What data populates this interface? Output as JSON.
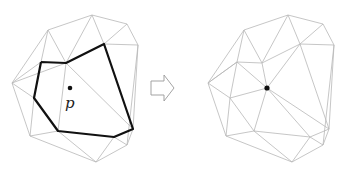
{
  "diagram": {
    "left": {
      "point_label": "p",
      "point": [
        70,
        88
      ],
      "vertices": {
        "A": [
          48,
          30
        ],
        "B": [
          92,
          15
        ],
        "C": [
          127,
          24
        ],
        "D": [
          138,
          45
        ],
        "E": [
          12,
          83
        ],
        "F": [
          41,
          62
        ],
        "G": [
          66,
          63
        ],
        "H": [
          104,
          44
        ],
        "I": [
          34,
          98
        ],
        "J": [
          58,
          131
        ],
        "K": [
          114,
          137
        ],
        "L": [
          133,
          129
        ],
        "M": [
          30,
          136
        ],
        "N": [
          96,
          162
        ],
        "O": [
          127,
          145
        ]
      },
      "polygon": [
        "F",
        "G",
        "H",
        "L",
        "K",
        "J",
        "I"
      ],
      "edges": [
        [
          "A",
          "B"
        ],
        [
          "B",
          "C"
        ],
        [
          "C",
          "D"
        ],
        [
          "A",
          "E"
        ],
        [
          "E",
          "M"
        ],
        [
          "M",
          "N"
        ],
        [
          "N",
          "O"
        ],
        [
          "O",
          "D"
        ],
        [
          "A",
          "F"
        ],
        [
          "A",
          "G"
        ],
        [
          "B",
          "G"
        ],
        [
          "B",
          "H"
        ],
        [
          "C",
          "H"
        ],
        [
          "D",
          "H"
        ],
        [
          "E",
          "F"
        ],
        [
          "E",
          "I"
        ],
        [
          "E",
          "G"
        ],
        [
          "I",
          "M"
        ],
        [
          "M",
          "J"
        ],
        [
          "J",
          "N"
        ],
        [
          "K",
          "N"
        ],
        [
          "K",
          "O"
        ],
        [
          "L",
          "O"
        ],
        [
          "G",
          "J"
        ],
        [
          "G",
          "L"
        ],
        [
          "D",
          "L"
        ]
      ]
    },
    "arrow": {
      "direction": "right",
      "x": 161,
      "y": 88
    },
    "right": {
      "point": [
        267,
        88
      ],
      "vertices": {
        "A": [
          244,
          30
        ],
        "B": [
          288,
          15
        ],
        "C": [
          323,
          24
        ],
        "D": [
          334,
          45
        ],
        "E": [
          208,
          83
        ],
        "F": [
          237,
          62
        ],
        "G": [
          262,
          63
        ],
        "H": [
          300,
          44
        ],
        "I": [
          230,
          98
        ],
        "J": [
          254,
          131
        ],
        "K": [
          310,
          137
        ],
        "L": [
          329,
          129
        ],
        "M": [
          226,
          136
        ],
        "N": [
          292,
          162
        ],
        "O": [
          323,
          145
        ]
      },
      "edges": [
        [
          "A",
          "B"
        ],
        [
          "B",
          "C"
        ],
        [
          "C",
          "D"
        ],
        [
          "A",
          "E"
        ],
        [
          "E",
          "M"
        ],
        [
          "M",
          "N"
        ],
        [
          "N",
          "O"
        ],
        [
          "O",
          "D"
        ],
        [
          "A",
          "F"
        ],
        [
          "A",
          "G"
        ],
        [
          "B",
          "G"
        ],
        [
          "B",
          "H"
        ],
        [
          "C",
          "H"
        ],
        [
          "D",
          "H"
        ],
        [
          "E",
          "F"
        ],
        [
          "E",
          "I"
        ],
        [
          "I",
          "M"
        ],
        [
          "M",
          "J"
        ],
        [
          "J",
          "N"
        ],
        [
          "K",
          "N"
        ],
        [
          "K",
          "O"
        ],
        [
          "L",
          "O"
        ],
        [
          "D",
          "L"
        ],
        [
          "F",
          "G"
        ],
        [
          "G",
          "H"
        ],
        [
          "H",
          "L"
        ],
        [
          "L",
          "K"
        ],
        [
          "K",
          "J"
        ],
        [
          "J",
          "I"
        ],
        [
          "I",
          "F"
        ],
        [
          "P",
          "F"
        ],
        [
          "P",
          "G"
        ],
        [
          "P",
          "H"
        ],
        [
          "P",
          "L"
        ],
        [
          "P",
          "K"
        ],
        [
          "P",
          "J"
        ],
        [
          "P",
          "I"
        ],
        [
          "F",
          "E"
        ]
      ]
    }
  }
}
